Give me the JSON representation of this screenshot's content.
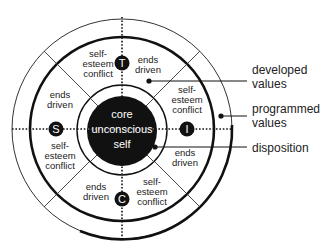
{
  "diagram": {
    "colors": {
      "ink": "#111111",
      "background": "#ffffff",
      "core_text": "#ffffff"
    },
    "core": {
      "lines": [
        "core",
        "unconscious",
        "self"
      ]
    },
    "nodes": {
      "top": "T",
      "left": "S",
      "right": "I",
      "bottom": "C"
    },
    "segments": {
      "top_left": {
        "lines": [
          "self-",
          "esteem",
          "conflict"
        ]
      },
      "top_right": {
        "lines": [
          "ends",
          "driven"
        ]
      },
      "right_upper": {
        "lines": [
          "self-",
          "esteem",
          "conflict"
        ]
      },
      "right_lower": {
        "lines": [
          "ends",
          "driven"
        ]
      },
      "bottom_right": {
        "lines": [
          "self-",
          "esteem",
          "conflict"
        ]
      },
      "bottom_left": {
        "lines": [
          "ends",
          "driven"
        ]
      },
      "left_lower": {
        "lines": [
          "self-",
          "esteem",
          "conflict"
        ]
      },
      "left_upper": {
        "lines": [
          "ends",
          "driven"
        ]
      }
    },
    "callouts": {
      "developed": {
        "lines": [
          "developed",
          "values"
        ]
      },
      "programmed": {
        "lines": [
          "programmed",
          "values"
        ]
      },
      "disposition": {
        "lines": [
          "disposition"
        ]
      }
    }
  }
}
